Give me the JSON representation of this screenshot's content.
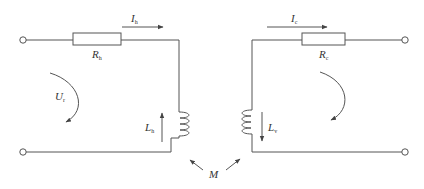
{
  "diagram": {
    "type": "coupled-inductor-circuit",
    "primary": {
      "current": {
        "symbol": "I",
        "sub": "h"
      },
      "resistor": {
        "symbol": "R",
        "sub": "h"
      },
      "inductor": {
        "symbol": "L",
        "sub": "h"
      },
      "voltage": {
        "symbol": "U",
        "sub": "r"
      }
    },
    "secondary": {
      "current": {
        "symbol": "I",
        "sub": "c"
      },
      "resistor": {
        "symbol": "R",
        "sub": "c"
      },
      "inductor": {
        "symbol": "L",
        "sub": "v"
      }
    },
    "mutual": {
      "symbol": "M"
    },
    "colors": {
      "line": "#444444",
      "text": "#333333"
    }
  }
}
